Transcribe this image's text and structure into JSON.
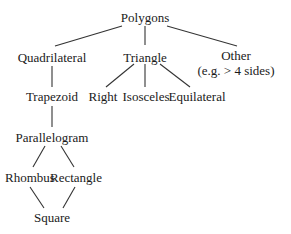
{
  "diagram": {
    "type": "tree",
    "title": "Polygons",
    "nodes": {
      "polygons": {
        "label": "Polygons",
        "x": 145,
        "y": 17
      },
      "quadrilateral": {
        "label": "Quadrilateral",
        "x": 52,
        "y": 57
      },
      "triangle": {
        "label": "Triangle",
        "x": 145,
        "y": 57
      },
      "other": {
        "label": "Other",
        "sublabel": "(e.g. > 4 sides)",
        "x": 236,
        "y": 55
      },
      "trapezoid": {
        "label": "Trapezoid",
        "x": 52,
        "y": 96
      },
      "right": {
        "label": "Right",
        "x": 103,
        "y": 96
      },
      "isosceles": {
        "label": "Isosceles",
        "x": 146,
        "y": 96
      },
      "equilateral": {
        "label": "Equilateral",
        "x": 197,
        "y": 96
      },
      "parallelogram": {
        "label": "Parallelogram",
        "x": 52,
        "y": 137
      },
      "rhombus": {
        "label": "Rhombus",
        "x": 30,
        "y": 177
      },
      "rectangle": {
        "label": "Rectangle",
        "x": 76,
        "y": 177
      },
      "square": {
        "label": "Square",
        "x": 52,
        "y": 217
      }
    },
    "edges": [
      {
        "from": "polygons",
        "to": "quadrilateral"
      },
      {
        "from": "polygons",
        "to": "triangle"
      },
      {
        "from": "polygons",
        "to": "other"
      },
      {
        "from": "quadrilateral",
        "to": "trapezoid"
      },
      {
        "from": "triangle",
        "to": "right"
      },
      {
        "from": "triangle",
        "to": "isosceles"
      },
      {
        "from": "triangle",
        "to": "equilateral"
      },
      {
        "from": "trapezoid",
        "to": "parallelogram"
      },
      {
        "from": "parallelogram",
        "to": "rhombus"
      },
      {
        "from": "parallelogram",
        "to": "rectangle"
      },
      {
        "from": "rhombus",
        "to": "square"
      },
      {
        "from": "rectangle",
        "to": "square"
      }
    ]
  }
}
